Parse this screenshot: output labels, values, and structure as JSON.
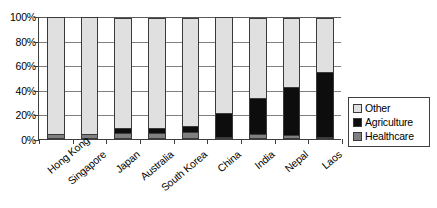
{
  "chart_data": {
    "type": "bar",
    "variant": "stacked-100-percent",
    "title": "",
    "subtitle": "",
    "xlabel": "",
    "ylabel": "",
    "categories": [
      "Hong Kong",
      "Singapore",
      "Japan",
      "Australia",
      "South Korea",
      "China",
      "India",
      "Nepal",
      "Laos"
    ],
    "series": [
      {
        "name": "Healthcare",
        "color": "#808080",
        "values": [
          4,
          4,
          5,
          5,
          6,
          1,
          4,
          3,
          2
        ]
      },
      {
        "name": "Agriculture",
        "color": "#0d0d0d",
        "values": [
          0,
          0,
          5,
          5,
          5,
          20,
          30,
          40,
          53
        ]
      },
      {
        "name": "Other",
        "color": "#e0e0e0",
        "values": [
          96,
          96,
          90,
          90,
          89,
          79,
          66,
          57,
          45
        ]
      }
    ],
    "stack_order_bottom_to_top": [
      "Healthcare",
      "Agriculture",
      "Other"
    ],
    "ylim": [
      0,
      100
    ],
    "yticks": [
      0,
      20,
      40,
      60,
      80,
      100
    ],
    "ytick_labels": [
      "0%",
      "20%",
      "40%",
      "60%",
      "80%",
      "100%"
    ],
    "grid": true,
    "grid_axis": "y",
    "legend_position": "right",
    "legend_entries": [
      {
        "label": "Other",
        "color": "#e0e0e0"
      },
      {
        "label": "Agriculture",
        "color": "#0d0d0d"
      },
      {
        "label": "Healthcare",
        "color": "#808080"
      }
    ]
  }
}
